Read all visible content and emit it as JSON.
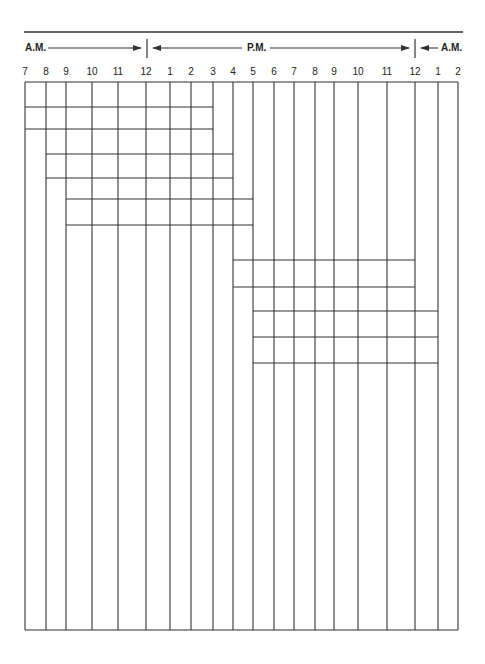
{
  "header": {
    "am_left_label": "A.M.",
    "pm_label": "P.M.",
    "am_right_label": "A.M."
  },
  "hours": [
    "7",
    "8",
    "9",
    "10",
    "11",
    "12",
    "1",
    "2",
    "3",
    "4",
    "5",
    "6",
    "7",
    "8",
    "9",
    "10",
    "11",
    "12",
    "1",
    "2"
  ],
  "colors": {
    "line": "#333333",
    "background": "#ffffff"
  },
  "geometry": {
    "grid_top": 82,
    "grid_bottom": 630,
    "top_rule_y": 32,
    "top_rule_x": [
      24,
      463
    ],
    "vertical_lines_x": [
      25,
      46,
      66,
      92,
      118,
      146,
      170,
      191,
      213,
      233,
      253,
      274,
      294,
      315,
      334,
      358,
      387,
      415,
      438,
      458
    ],
    "hour_label_x": [
      25,
      46,
      66,
      92,
      118,
      146,
      170,
      191,
      213,
      233,
      253,
      274,
      294,
      315,
      334,
      358,
      387,
      415,
      438,
      458
    ],
    "separators_x": [
      147,
      415
    ],
    "arrow_y": 48
  },
  "shift_blocks": [
    {
      "name": "shift-7am-3pm",
      "start": "7 A.M.",
      "end": "3 P.M.",
      "x1": 25,
      "x2": 213,
      "rows_y": [
        107,
        129
      ]
    },
    {
      "name": "shift-8am-4pm",
      "start": "8 A.M.",
      "end": "4 P.M.",
      "x1": 46,
      "x2": 233,
      "rows_y": [
        154,
        178
      ]
    },
    {
      "name": "shift-9am-5pm",
      "start": "9 A.M.",
      "end": "5 P.M.",
      "x1": 66,
      "x2": 253,
      "rows_y": [
        199,
        225
      ]
    },
    {
      "name": "shift-4pm-12am",
      "start": "4 P.M.",
      "end": "12 A.M.",
      "x1": 233,
      "x2": 415,
      "rows_y": [
        260,
        287
      ]
    },
    {
      "name": "shift-5pm-1am",
      "start": "5 P.M.",
      "end": "1 A.M.",
      "x1": 253,
      "x2": 438,
      "rows_y": [
        311,
        337,
        363
      ]
    }
  ]
}
